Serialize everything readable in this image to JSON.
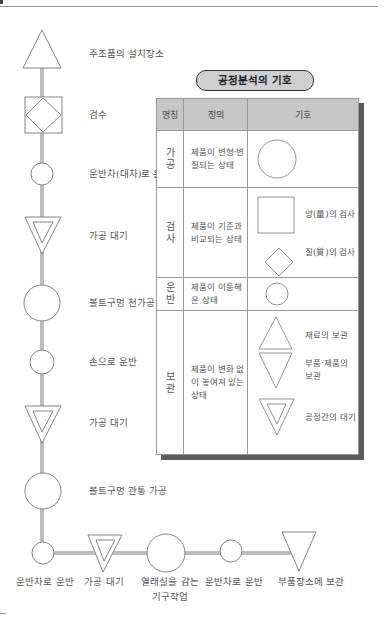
{
  "flow": {
    "steps": [
      {
        "symbol": "triangle-up",
        "label": "주조품의 설치장소"
      },
      {
        "symbol": "square-diamond",
        "label": "검수"
      },
      {
        "symbol": "small-circle",
        "label": "운반차(대차)로 운반"
      },
      {
        "symbol": "double-triangle-down",
        "label": "가공 대기"
      },
      {
        "symbol": "large-circle",
        "label": "볼트구멍 천가공"
      },
      {
        "symbol": "small-circle",
        "label": "손으로 운반"
      },
      {
        "symbol": "double-triangle-down",
        "label": "가공 대기"
      },
      {
        "symbol": "large-circle",
        "label": "볼트구멍 관통 가공"
      }
    ],
    "bottom_steps": [
      {
        "symbol": "small-circle",
        "label": "운반차로 운반"
      },
      {
        "symbol": "double-triangle-down",
        "label": "가공 대기"
      },
      {
        "symbol": "large-circle",
        "label": "열래실을 감는",
        "label2": "기구작업"
      },
      {
        "symbol": "small-circle",
        "label": "운반차로 운반"
      },
      {
        "symbol": "triangle-down",
        "label": "부품장소에 보관"
      }
    ]
  },
  "legend": {
    "title": "공정분석의 기호",
    "headers": {
      "name": "명칭",
      "definition": "정의",
      "symbol": "기호"
    },
    "rows": [
      {
        "name": "가\n공",
        "name_top": "가",
        "name_bottom": "공",
        "definition": "제품이 변형·변질되는 상태",
        "symbols": [
          {
            "shape": "circle",
            "label": ""
          }
        ]
      },
      {
        "name_top": "검",
        "name_bottom": "사",
        "definition": "제품이 기준과 비교되는 상태",
        "symbols": [
          {
            "shape": "square",
            "label": "양(量)의 검사"
          },
          {
            "shape": "diamond",
            "label": "질(質)의 검사"
          }
        ]
      },
      {
        "name_top": "운",
        "name_bottom": "반",
        "definition": "제품이 이동해 온 상태",
        "symbols": [
          {
            "shape": "small-circle",
            "label": ""
          }
        ]
      },
      {
        "name_top": "보",
        "name_bottom": "관",
        "definition": "제품이 변화 없이 놓여져 있는 상태",
        "symbols": [
          {
            "shape": "triangle-up",
            "label": "재료의 보관"
          },
          {
            "shape": "triangle-down",
            "label": "부품·제품의 보관"
          },
          {
            "shape": "double-triangle-down",
            "label": "공정간의 대기"
          }
        ]
      }
    ]
  },
  "colors": {
    "line": "#bdbdbd",
    "stroke": "#777777",
    "header_bg": "#c7c7c7",
    "shadow": "#5a5a5a"
  }
}
